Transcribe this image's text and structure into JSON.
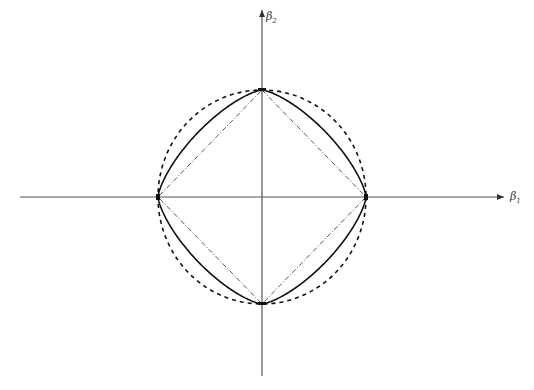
{
  "diagram": {
    "axes": {
      "x_label": "β",
      "x_sub": "1",
      "y_label": "β",
      "y_sub": "2"
    },
    "center": [
      262,
      197
    ],
    "radius_x": 104,
    "radius_y": 107,
    "curves": [
      {
        "name": "L1 diamond (lasso)",
        "style": "dash-dot",
        "color": "#333333"
      },
      {
        "name": "Lq ball, 1<q<2 (elastic-net-like)",
        "style": "solid",
        "color": "#111111"
      },
      {
        "name": "L2 circle (ridge)",
        "style": "dashed",
        "color": "#111111"
      }
    ]
  }
}
